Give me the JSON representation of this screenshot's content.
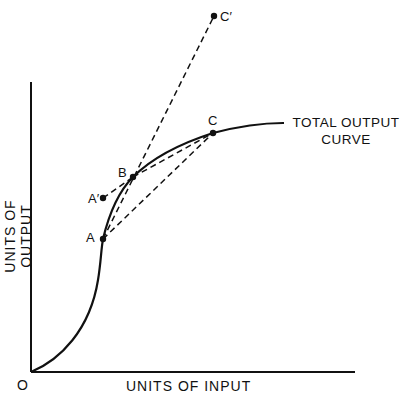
{
  "diagram": {
    "title": "",
    "axes": {
      "x_label": "UNITS OF INPUT",
      "y_label": "UNITS OF OUTPUT",
      "origin_label": "O"
    },
    "curve_label_line1": "TOTAL OUTPUT",
    "curve_label_line2": "CURVE",
    "points": {
      "A": "A",
      "A_prime": "A′",
      "B": "B",
      "C": "C",
      "C_prime": "C′"
    },
    "colors": {
      "ink": "#111111",
      "background": "#ffffff"
    }
  }
}
